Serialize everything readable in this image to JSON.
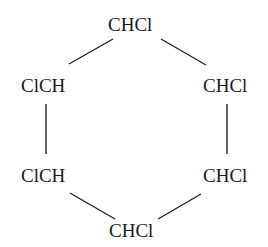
{
  "diagram": {
    "type": "chemical-structure",
    "nodes": [
      {
        "id": "c1",
        "label": "CHCl",
        "position": "top"
      },
      {
        "id": "c2",
        "label": "CHCl",
        "position": "upper-right"
      },
      {
        "id": "c3",
        "label": "CHCl",
        "position": "lower-right"
      },
      {
        "id": "c4",
        "label": "CHCl",
        "position": "bottom"
      },
      {
        "id": "c5",
        "label": "ClCH",
        "position": "lower-left"
      },
      {
        "id": "c6",
        "label": "ClCH",
        "position": "upper-left"
      }
    ],
    "bonds": [
      [
        "c1",
        "c2"
      ],
      [
        "c2",
        "c3"
      ],
      [
        "c3",
        "c4"
      ],
      [
        "c4",
        "c5"
      ],
      [
        "c5",
        "c6"
      ],
      [
        "c6",
        "c1"
      ]
    ],
    "line_color": "#222222"
  }
}
